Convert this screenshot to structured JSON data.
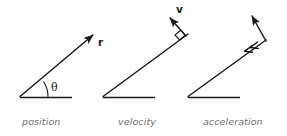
{
  "figure": {
    "width": 287,
    "height": 136,
    "background_color": "#ffffff",
    "stroke_color": "#1a1a1a",
    "caption_color": "#6f6f6f"
  },
  "panels": [
    {
      "id": "position",
      "caption": "position",
      "vector_label": "r",
      "angle_label": "θ",
      "elements": [
        "baseline",
        "position-vector-arrow",
        "angle-arc",
        "angle-label"
      ]
    },
    {
      "id": "velocity",
      "caption": "velocity",
      "vector_label": "v",
      "elements": [
        "baseline",
        "radius-line",
        "velocity-vector-arrow",
        "right-angle-marker"
      ]
    },
    {
      "id": "acceleration",
      "caption": "acceleration",
      "elements": [
        "baseline",
        "radius-line-with-inward-double-arrow",
        "tangential-vector-arrow"
      ]
    }
  ],
  "labels": {
    "r": "r",
    "v": "v",
    "theta": "θ",
    "position": "position",
    "velocity": "velocity",
    "acceleration": "acceleration"
  }
}
